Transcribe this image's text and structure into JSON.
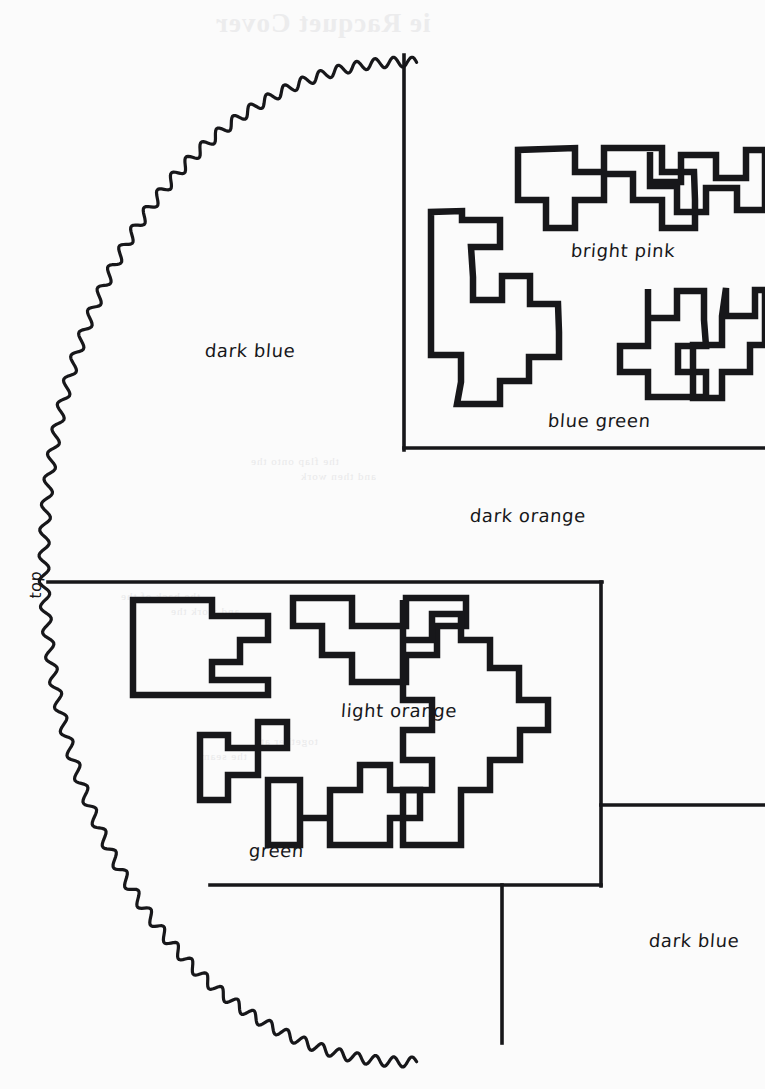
{
  "page": {
    "width": 765,
    "height": 1089,
    "background_color": "#fbfbfb",
    "ink_color": "#17171a"
  },
  "bleedthrough": {
    "note": "Faint mirrored show-through text from the reverse side of the page",
    "lines": [
      {
        "text": "ie Racquet Cover",
        "x": 215,
        "y": 8,
        "size": 27
      },
      {
        "text": "the flap onto the",
        "x": 250,
        "y": 455,
        "size": 11
      },
      {
        "text": "and then work",
        "x": 300,
        "y": 470,
        "size": 11
      },
      {
        "text": "the back of the",
        "x": 120,
        "y": 590,
        "size": 11
      },
      {
        "text": "and work the",
        "x": 170,
        "y": 605,
        "size": 11
      },
      {
        "text": "together at",
        "x": 260,
        "y": 735,
        "size": 11
      },
      {
        "text": "the seam",
        "x": 200,
        "y": 750,
        "size": 11
      }
    ]
  },
  "outline": {
    "name": "scalloped-half-circle",
    "style": "wavy scalloped arc",
    "wave_amplitude": 5,
    "wave_length": 22,
    "stroke_width": 3.2,
    "label_top": "top",
    "arc": {
      "center_x": 404,
      "center_y": 562,
      "radius_x": 360,
      "radius_y": 500,
      "start_angle_deg": -92,
      "end_angle_deg": 92
    }
  },
  "labels": [
    {
      "id": "top",
      "text": "top",
      "x": 26,
      "y": 598,
      "rotated": true,
      "size": 16
    },
    {
      "id": "dark-blue-1",
      "text": "dark  blue",
      "x": 205,
      "y": 340,
      "rotated": false,
      "size": 18
    },
    {
      "id": "bright-pink",
      "text": "bright pink",
      "x": 571,
      "y": 240,
      "rotated": false,
      "size": 18
    },
    {
      "id": "blue-green",
      "text": "blue green",
      "x": 548,
      "y": 410,
      "rotated": false,
      "size": 18
    },
    {
      "id": "dark-orange",
      "text": "dark orange",
      "x": 470,
      "y": 505,
      "rotated": false,
      "size": 18
    },
    {
      "id": "light-orange",
      "text": "light orange",
      "x": 341,
      "y": 700,
      "rotated": false,
      "size": 18
    },
    {
      "id": "green",
      "text": "green",
      "x": 249,
      "y": 840,
      "rotated": false,
      "size": 18
    },
    {
      "id": "dark-blue-2",
      "text": "dark blue",
      "x": 649,
      "y": 930,
      "rotated": false,
      "size": 18
    }
  ],
  "dividers": [
    {
      "id": "divider-vertical-top",
      "orientation": "vertical",
      "x": 404,
      "y1": 55,
      "y2": 450
    },
    {
      "id": "divider-horizontal-upper",
      "orientation": "horizontal",
      "y": 448,
      "x1": 404,
      "x2": 765
    },
    {
      "id": "divider-horizontal-mid",
      "orientation": "horizontal",
      "y": 582,
      "x1": 48,
      "x2": 602
    },
    {
      "id": "divider-vertical-right",
      "orientation": "vertical",
      "x": 601,
      "y1": 582,
      "y2": 886
    },
    {
      "id": "divider-horizontal-right",
      "orientation": "horizontal",
      "y": 805,
      "x1": 601,
      "x2": 765
    },
    {
      "id": "divider-horizontal-low",
      "orientation": "horizontal",
      "y": 885,
      "x1": 210,
      "x2": 601
    },
    {
      "id": "divider-vertical-bottom",
      "orientation": "vertical",
      "x": 502,
      "y1": 885,
      "y2": 1043
    }
  ],
  "motifs": {
    "note": "Stepped pixel-block outline shapes drawn inside each color section",
    "sections": [
      {
        "id": "bright-pink-motifs",
        "count": 6
      },
      {
        "id": "blue-green-motifs",
        "count": 4
      },
      {
        "id": "light-orange-motifs",
        "count": 4
      },
      {
        "id": "green-motifs",
        "count": 3
      }
    ],
    "paths": [
      "M431,212 L431,355 L461,355 L461,382 L457,404 L500,404 L500,381 L529,381 L529,357 L559,357 L559,332 L558,304 L530,304 L530,276 L502,276 L502,300 L473,300 L473,277 L471,247 L500,247 L500,220 L462,220 L462,211 Z",
      "M518,150 L518,200 L546,200 L546,228 L575,228 L575,200 L604,200 L604,174 L633,174 L633,200 L662,200 L662,228 L695,228 L695,200 L694,172 L662,172 L662,148 L604,148 L604,172 L575,172 L575,148 Z",
      "M650,152 L650,182 L681,182 L681,155 L716,155 L716,178 L746,178 L746,150 L765,150 L765,210 L737,210 L737,188 L706,188 L706,212 L677,212 L677,186 L650,186 Z",
      "M648,289 L648,318 L677,318 L677,291 L704,291 L704,320 L706,346 L678,346 L678,372 L706,372 L706,397 L648,397 L648,372 L620,372 L620,346 L648,346 Z",
      "M726,288 L726,316 L755,316 L755,290 L765,290 L765,345 L750,345 L750,372 L722,372 L722,398 L693,398 L693,345 L722,345 L722,316 Z",
      "M133,600 L133,695 L268,695 L268,680 L212,680 L212,662 L240,662 L240,640 L268,640 L268,616 L212,616 L212,600 Z",
      "M293,598 L293,626 L322,626 L322,655 L352,655 L352,682 L406,682 L406,655 L437,655 L437,626 L466,626 L466,598 L406,598 L406,626 L352,626 L352,598 Z",
      "M403,600 L403,640 L432,640 L432,614 L461,614 L461,640 L490,640 L490,668 L519,668 L519,700 L548,700 L548,730 L520,730 L520,760 L490,760 L490,790 L461,790 L461,845 L403,845 L403,790 L432,790 L432,760 L403,760 L403,730 L432,730 L432,700 L403,700 Z",
      "M200,735 L200,800 L228,800 L228,775 L258,775 L258,748 L287,748 L287,722 L258,722 L258,748 L228,748 L228,735 Z",
      "M268,780 L268,845 L300,845 L300,818 L330,818 L330,790 L360,790 L360,765 L390,765 L390,790 L420,790 L420,818 L390,818 L390,845 L330,845 L330,818 L300,818 L300,780 Z"
    ]
  }
}
